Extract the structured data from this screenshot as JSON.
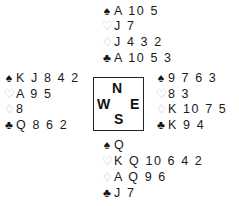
{
  "hands": {
    "north": {
      "spades": "A 10 5",
      "hearts": "J 7",
      "diamonds": "J 4 3 2",
      "clubs": "A 10 5 3"
    },
    "west": {
      "spades": "K J 8 4 2",
      "hearts": "A 9 5",
      "diamonds": "8",
      "clubs": "Q 8 6 2"
    },
    "east": {
      "spades": "9 7 6 3",
      "hearts": "8 3",
      "diamonds": "K 10 7 5",
      "clubs": "K 9 4"
    },
    "south": {
      "spades": "Q",
      "hearts": "K Q 10 6 4 2",
      "diamonds": "A Q 9 6",
      "clubs": "J 7"
    }
  },
  "suit_symbols": {
    "spades": "♠",
    "hearts": "♡",
    "diamonds": "♢",
    "clubs": "♣"
  },
  "compass": {
    "north": "N",
    "west": "W",
    "east": "E",
    "south": "S"
  }
}
